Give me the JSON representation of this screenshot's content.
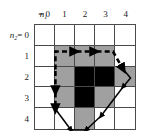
{
  "figure": {
    "name": "discrete-grid-contour-figure",
    "background": "#ffffff",
    "grid": {
      "rows": 5,
      "cols": 5,
      "line_color": "#4a4a4a",
      "colors": {
        "white": "#ffffff",
        "gray": "#a0a0a0",
        "black": "#000000"
      },
      "cells": [
        [
          "white",
          "white",
          "white",
          "white",
          "white"
        ],
        [
          "white",
          "gray",
          "gray",
          "gray",
          "white"
        ],
        [
          "white",
          "gray",
          "black",
          "black",
          "gray"
        ],
        [
          "white",
          "gray",
          "black",
          "gray",
          "white"
        ],
        [
          "white",
          "white",
          "gray",
          "white",
          "white"
        ]
      ]
    },
    "x_axis": {
      "variable": "n",
      "subscript": "1",
      "first_label": "= 0",
      "ticks": [
        "1",
        "2",
        "3",
        "4"
      ]
    },
    "y_axis": {
      "variable": "n",
      "subscript": "2",
      "first_label": "= 0",
      "ticks": [
        "1",
        "2",
        "3",
        "4"
      ]
    },
    "contour": {
      "stroke": "#000000",
      "dashed_segments": "upper-left boundary",
      "solid_segments": "right and lower boundary",
      "arrow_heads": 8
    }
  }
}
